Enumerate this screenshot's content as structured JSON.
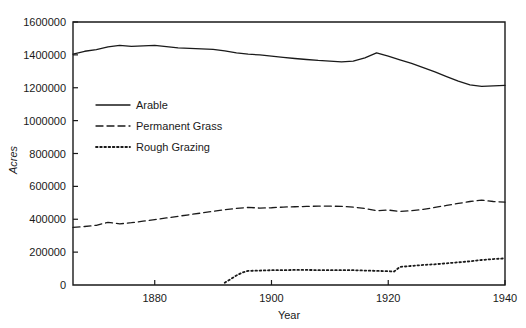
{
  "chart_data": {
    "type": "line",
    "title": "",
    "xlabel": "Year",
    "ylabel": "Acres",
    "xlim": [
      1866,
      1940
    ],
    "ylim": [
      0,
      1600000
    ],
    "grid": false,
    "legend_position": "inside-upper-left",
    "x_ticks": [
      1880,
      1900,
      1920,
      1940
    ],
    "x_tick_labels": [
      "1880",
      "1900",
      "1920",
      "1940"
    ],
    "y_ticks": [
      0,
      200000,
      400000,
      600000,
      800000,
      1000000,
      1200000,
      1400000,
      1600000
    ],
    "y_tick_labels": [
      "0",
      "200000",
      "400000",
      "600000",
      "800000",
      "1000000",
      "1200000",
      "1400000",
      "1600000"
    ],
    "origin_label": "0",
    "series": [
      {
        "name": "Arable",
        "style": "solid",
        "x": [
          1866,
          1868,
          1870,
          1872,
          1874,
          1876,
          1878,
          1880,
          1882,
          1884,
          1886,
          1888,
          1890,
          1892,
          1894,
          1896,
          1898,
          1900,
          1902,
          1904,
          1906,
          1908,
          1910,
          1912,
          1914,
          1916,
          1918,
          1920,
          1922,
          1924,
          1926,
          1928,
          1930,
          1932,
          1934,
          1936,
          1938,
          1940
        ],
        "values": [
          1405000,
          1422000,
          1432000,
          1448000,
          1458000,
          1452000,
          1455000,
          1458000,
          1450000,
          1443000,
          1440000,
          1437000,
          1433000,
          1424000,
          1412000,
          1404000,
          1400000,
          1392000,
          1385000,
          1378000,
          1372000,
          1366000,
          1362000,
          1358000,
          1362000,
          1382000,
          1412000,
          1392000,
          1370000,
          1348000,
          1322000,
          1296000,
          1268000,
          1240000,
          1218000,
          1208000,
          1212000,
          1214000
        ]
      },
      {
        "name": "Permanent Grass",
        "style": "dashed",
        "x": [
          1866,
          1868,
          1870,
          1872,
          1874,
          1876,
          1878,
          1880,
          1882,
          1884,
          1886,
          1888,
          1890,
          1892,
          1894,
          1896,
          1898,
          1900,
          1902,
          1904,
          1906,
          1908,
          1910,
          1912,
          1914,
          1916,
          1918,
          1920,
          1922,
          1924,
          1926,
          1928,
          1930,
          1932,
          1934,
          1936,
          1938,
          1940
        ],
        "values": [
          350000,
          356000,
          363000,
          381000,
          372000,
          379000,
          388000,
          398000,
          408000,
          418000,
          428000,
          438000,
          448000,
          458000,
          466000,
          472000,
          468000,
          470000,
          474000,
          476000,
          478000,
          480000,
          480000,
          478000,
          474000,
          466000,
          452000,
          456000,
          448000,
          452000,
          460000,
          472000,
          484000,
          496000,
          508000,
          516000,
          508000,
          504000
        ]
      },
      {
        "name": "Rough Grazing",
        "style": "dotted",
        "x": [
          1892,
          1893,
          1894,
          1895,
          1896,
          1898,
          1900,
          1902,
          1904,
          1906,
          1908,
          1910,
          1912,
          1914,
          1916,
          1918,
          1920,
          1921,
          1922,
          1924,
          1926,
          1928,
          1930,
          1932,
          1934,
          1936,
          1938,
          1940
        ],
        "values": [
          14000,
          36000,
          58000,
          76000,
          86000,
          88000,
          90000,
          90000,
          92000,
          92000,
          90000,
          90000,
          90000,
          90000,
          88000,
          86000,
          84000,
          82000,
          110000,
          116000,
          122000,
          126000,
          132000,
          138000,
          144000,
          152000,
          158000,
          162000
        ]
      }
    ],
    "legend_entries": [
      {
        "label": "Arable",
        "style": "solid"
      },
      {
        "label": "Permanent Grass",
        "style": "dashed"
      },
      {
        "label": "Rough Grazing",
        "style": "dotted"
      }
    ]
  }
}
